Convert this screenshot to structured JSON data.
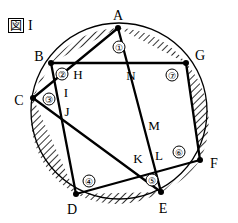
{
  "figure": {
    "caption_boxed": "図",
    "caption_roman": "I",
    "title": "図 I",
    "type": "circle-inscribed-heptagon-star",
    "colors": {
      "stroke": "#000000",
      "fill": "#ffffff",
      "hatch": "#000000"
    },
    "circle": {
      "cx": 119,
      "cy": 111,
      "r": 88,
      "stroke_width": 1.2
    }
  },
  "circle_points": [
    {
      "id": "A",
      "label": "A",
      "x": 118,
      "y": 28,
      "label_x": 118,
      "label_y": 16
    },
    {
      "id": "B",
      "label": "B",
      "x": 51,
      "y": 63,
      "label_x": 39,
      "label_y": 57
    },
    {
      "id": "C",
      "label": "C",
      "x": 33,
      "y": 98,
      "label_x": 19,
      "label_y": 101
    },
    {
      "id": "D",
      "label": "D",
      "x": 76,
      "y": 194,
      "label_x": 72,
      "label_y": 210
    },
    {
      "id": "E",
      "label": "E",
      "x": 161,
      "y": 192,
      "label_x": 163,
      "label_y": 209
    },
    {
      "id": "F",
      "label": "F",
      "x": 200,
      "y": 160,
      "label_x": 214,
      "label_y": 164
    },
    {
      "id": "G",
      "label": "G",
      "x": 186,
      "y": 63,
      "label_x": 200,
      "label_y": 56
    }
  ],
  "inner_points": [
    {
      "id": "H",
      "label": "H",
      "x": 72,
      "y": 66,
      "label_x": 78,
      "label_y": 74
    },
    {
      "id": "I",
      "label": "I",
      "x": 63,
      "y": 83,
      "label_x": 66,
      "label_y": 92
    },
    {
      "id": "J",
      "label": "J",
      "x": 70,
      "y": 108,
      "label_x": 67,
      "label_y": 111
    },
    {
      "id": "K",
      "label": "K",
      "x": 146,
      "y": 167,
      "label_x": 138,
      "label_y": 158
    },
    {
      "id": "L",
      "label": "L",
      "x": 160,
      "y": 165,
      "label_x": 159,
      "label_y": 155
    },
    {
      "id": "M",
      "label": "M",
      "x": 166,
      "y": 133,
      "label_x": 154,
      "label_y": 125
    },
    {
      "id": "N",
      "label": "N",
      "x": 140,
      "y": 63,
      "label_x": 131,
      "label_y": 75
    }
  ],
  "segment_numbers": [
    {
      "id": "seg-1",
      "label": "①",
      "x": 119,
      "y": 47
    },
    {
      "id": "seg-2",
      "label": "②",
      "x": 62,
      "y": 74
    },
    {
      "id": "seg-3",
      "label": "③",
      "x": 49,
      "y": 99
    },
    {
      "id": "seg-4",
      "label": "④",
      "x": 89,
      "y": 181
    },
    {
      "id": "seg-5",
      "label": "⑤",
      "x": 152,
      "y": 180
    },
    {
      "id": "seg-6",
      "label": "⑥",
      "x": 179,
      "y": 152
    },
    {
      "id": "seg-7",
      "label": "⑦",
      "x": 172,
      "y": 75
    }
  ],
  "chords": [
    {
      "id": "chord-A-E",
      "from": "A",
      "to": "E"
    },
    {
      "id": "chord-B-G",
      "from": "B",
      "to": "G"
    },
    {
      "id": "chord-C-A",
      "from": "C",
      "to": "A"
    },
    {
      "id": "chord-D-B",
      "from": "D",
      "to": "B"
    },
    {
      "id": "chord-E-C",
      "from": "E",
      "to": "C"
    },
    {
      "id": "chord-F-D",
      "from": "F",
      "to": "D"
    },
    {
      "id": "chord-G-F",
      "from": "G",
      "to": "F"
    }
  ],
  "hatched_segments": [
    {
      "id": "hatch-1",
      "number": "①",
      "chord_from": "A",
      "chord_to": "G"
    },
    {
      "id": "hatch-2",
      "number": "②",
      "chord_from": "B",
      "chord_to": "A"
    },
    {
      "id": "hatch-3",
      "number": "③",
      "chord_from": "C",
      "chord_to": "B"
    },
    {
      "id": "hatch-4",
      "number": "④",
      "chord_from": "D",
      "chord_to": "C"
    },
    {
      "id": "hatch-5",
      "number": "⑤",
      "chord_from": "E",
      "chord_to": "D"
    },
    {
      "id": "hatch-6",
      "number": "⑥",
      "chord_from": "F",
      "chord_to": "E"
    },
    {
      "id": "hatch-7",
      "number": "⑦",
      "chord_from": "G",
      "chord_to": "F"
    }
  ]
}
